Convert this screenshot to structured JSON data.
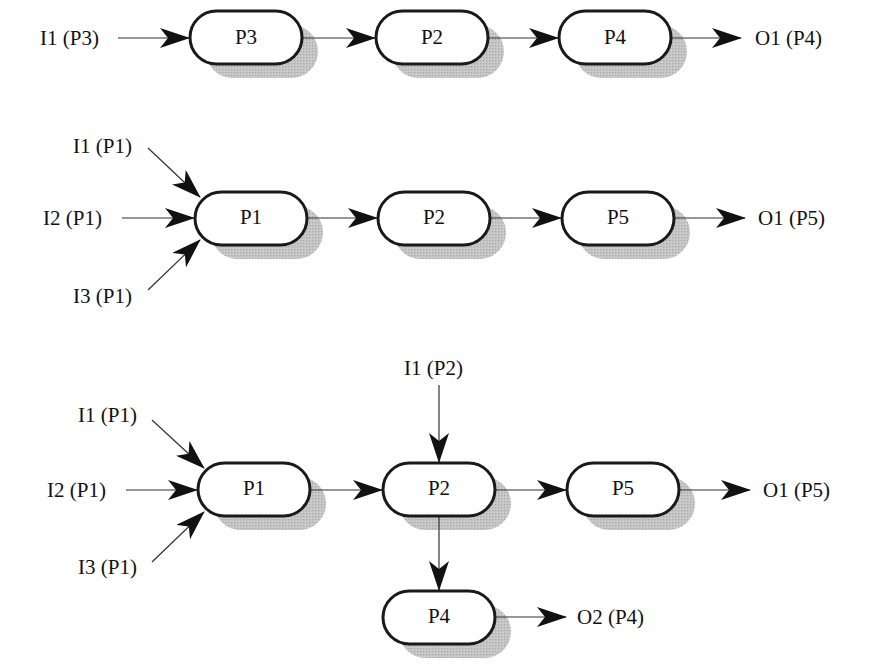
{
  "diagram": {
    "type": "process-flow",
    "colors": {
      "node_fill": "#ffffff",
      "node_stroke": "#1a1a1a",
      "shadow": "#bdbdbd",
      "edge": "#333333",
      "arrowhead": "#111111",
      "text": "#111111"
    },
    "flows": [
      {
        "id": "flow-1",
        "inputs": [
          {
            "label": "I1 (P3)",
            "target": "P3"
          }
        ],
        "nodes": [
          {
            "id": "f1-p3",
            "label": "P3"
          },
          {
            "id": "f1-p2",
            "label": "P2"
          },
          {
            "id": "f1-p4",
            "label": "P4"
          }
        ],
        "edges": [
          {
            "from": "P3",
            "to": "P2"
          },
          {
            "from": "P2",
            "to": "P4"
          }
        ],
        "outputs": [
          {
            "label": "O1 (P4)",
            "source": "P4"
          }
        ]
      },
      {
        "id": "flow-2",
        "inputs": [
          {
            "label": "I1 (P1)",
            "target": "P1"
          },
          {
            "label": "I2 (P1)",
            "target": "P1"
          },
          {
            "label": "I3 (P1)",
            "target": "P1"
          }
        ],
        "nodes": [
          {
            "id": "f2-p1",
            "label": "P1"
          },
          {
            "id": "f2-p2",
            "label": "P2"
          },
          {
            "id": "f2-p5",
            "label": "P5"
          }
        ],
        "edges": [
          {
            "from": "P1",
            "to": "P2"
          },
          {
            "from": "P2",
            "to": "P5"
          }
        ],
        "outputs": [
          {
            "label": "O1 (P5)",
            "source": "P5"
          }
        ]
      },
      {
        "id": "flow-3",
        "inputs": [
          {
            "label": "I1 (P1)",
            "target": "P1"
          },
          {
            "label": "I2 (P1)",
            "target": "P1"
          },
          {
            "label": "I3 (P1)",
            "target": "P1"
          },
          {
            "label": "I1 (P2)",
            "target": "P2"
          }
        ],
        "nodes": [
          {
            "id": "f3-p1",
            "label": "P1"
          },
          {
            "id": "f3-p2",
            "label": "P2"
          },
          {
            "id": "f3-p5",
            "label": "P5"
          },
          {
            "id": "f3-p4",
            "label": "P4"
          }
        ],
        "edges": [
          {
            "from": "P1",
            "to": "P2"
          },
          {
            "from": "P2",
            "to": "P5"
          },
          {
            "from": "P2",
            "to": "P4"
          }
        ],
        "outputs": [
          {
            "label": "O1 (P5)",
            "source": "P5"
          },
          {
            "label": "O2 (P4)",
            "source": "P4"
          }
        ]
      }
    ]
  }
}
